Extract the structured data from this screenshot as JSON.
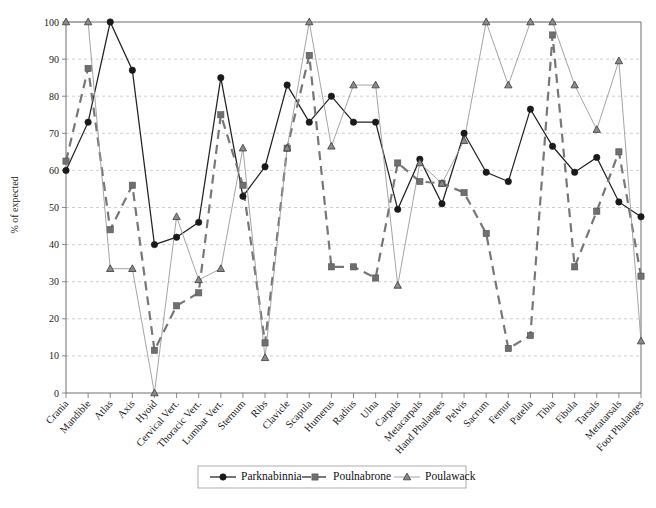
{
  "chart_data": {
    "type": "line",
    "title": "",
    "xlabel": "",
    "ylabel": "% of expected",
    "ylim": [
      0,
      100
    ],
    "ytick_step": 10,
    "yticks": [
      0,
      10,
      20,
      30,
      40,
      50,
      60,
      70,
      80,
      90,
      100
    ],
    "grid": true,
    "legend_position": "bottom-center",
    "categories": [
      "Crania",
      "Mandible",
      "Atlas",
      "Axis",
      "Hyoid",
      "Cervical Vert.",
      "Thoracic Vert.",
      "Lumbar Vert.",
      "Sternum",
      "Ribs",
      "Clavicle",
      "Scapula",
      "Humerus",
      "Radius",
      "Ulna",
      "Carpals",
      "Metacarpals",
      "Hand Phalanges",
      "Pelvis",
      "Sacrum",
      "Femur",
      "Patella",
      "Tibia",
      "Fibula",
      "Tarsals",
      "Metatarsals",
      "Foot Phalanges"
    ],
    "series": [
      {
        "name": "Parknabinnia",
        "color": "#222222",
        "marker": "circle",
        "linestyle": "solid",
        "values": [
          60,
          73,
          100,
          87,
          40,
          42,
          46,
          85,
          53,
          61,
          83,
          73,
          80,
          73,
          73,
          49.5,
          63,
          51,
          70,
          59.5,
          57,
          76.5,
          66.5,
          59.5,
          63.5,
          51.5,
          47.5
        ]
      },
      {
        "name": "Poulnabrone",
        "color": "#777777",
        "marker": "square",
        "linestyle": "dashed",
        "values": [
          62.5,
          87.5,
          44,
          56,
          11.5,
          23.5,
          27,
          75,
          56,
          13.5,
          66,
          91,
          34,
          34,
          31,
          62,
          57,
          56.5,
          54,
          43,
          12,
          15.5,
          96.5,
          34,
          49,
          65,
          31.5
        ]
      },
      {
        "name": "Poulawack",
        "color": "#9a9a9a",
        "marker": "triangle",
        "linestyle": "solid-thin",
        "values": [
          100,
          100,
          33.5,
          33.5,
          0,
          47.5,
          30.5,
          33.5,
          66,
          9.5,
          66,
          100,
          66.5,
          83,
          83,
          29,
          62,
          56.5,
          68,
          100,
          83,
          100,
          100,
          83,
          71,
          89.5,
          14
        ]
      }
    ]
  },
  "legend": {
    "entries": [
      {
        "label": "Parknabinnia"
      },
      {
        "label": "Poulnabrone"
      },
      {
        "label": "Poulawack"
      }
    ]
  }
}
